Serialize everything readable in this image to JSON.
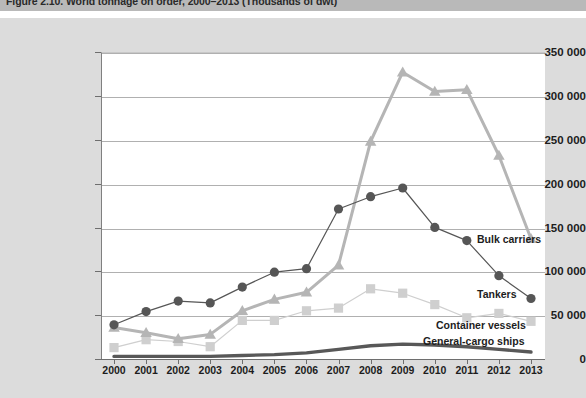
{
  "figure": {
    "caption": "Figure 2.10.  World tonnage on order, 2000–2013 (Thousands of dwt)"
  },
  "colors": {
    "panel_background": "#dcdcdc",
    "plot_background": "#ffffff",
    "caption_bar": "#b9b9b9",
    "gridline": "#b0b0b0",
    "axis": "#6e6e6e",
    "tankers": "#565656",
    "bulk_carriers": "#b5b5b5",
    "container_vessels": "#cfcfcf",
    "general_cargo_ships": "#585858"
  },
  "chart_data": {
    "type": "line",
    "title": "Figure 2.10.  World tonnage on order, 2000–2013 (Thousands of dwt)",
    "xlabel": "",
    "ylabel": "",
    "grid": true,
    "legend_position": "inline-right",
    "ylim": [
      0,
      350000
    ],
    "yticks": [
      0,
      50000,
      100000,
      150000,
      200000,
      250000,
      300000,
      350000
    ],
    "ytick_labels": [
      "0",
      "50 000",
      "100 000",
      "150 000",
      "200 000",
      "250 000",
      "300 000",
      "350 000"
    ],
    "categories": [
      2000,
      2001,
      2002,
      2003,
      2004,
      2005,
      2006,
      2007,
      2008,
      2009,
      2010,
      2011,
      2012,
      2013
    ],
    "xtick_labels": [
      "2000",
      "2001",
      "2002",
      "2003",
      "2004",
      "2005",
      "2006",
      "2007",
      "2008",
      "2009",
      "2010",
      "2011",
      "2012",
      "2013"
    ],
    "series": [
      {
        "name": "Tankers",
        "marker": "circle",
        "color": "#565656",
        "values": [
          39000,
          54000,
          66000,
          64000,
          82000,
          99000,
          103000,
          171000,
          185000,
          195000,
          150000,
          135000,
          95000,
          69000
        ]
      },
      {
        "name": "Bulk carriers",
        "marker": "triangle",
        "color": "#b5b5b5",
        "values": [
          36000,
          30000,
          23000,
          28000,
          55000,
          68000,
          76000,
          107000,
          248000,
          327000,
          305000,
          307000,
          232000,
          137000
        ]
      },
      {
        "name": "Container vessels",
        "marker": "square",
        "color": "#cfcfcf",
        "values": [
          13000,
          22000,
          20000,
          14000,
          44000,
          44000,
          55000,
          58000,
          80000,
          75000,
          62000,
          47000,
          52000,
          43000
        ]
      },
      {
        "name": "General-cargo ships",
        "marker": "none",
        "color": "#585858",
        "values": [
          3000,
          3000,
          3000,
          3000,
          4000,
          5000,
          7000,
          11000,
          15000,
          17000,
          16000,
          14000,
          11000,
          8000
        ]
      }
    ]
  },
  "series_labels": {
    "bulk_carriers": "Bulk carriers",
    "tankers": "Tankers",
    "container_vessels": "Container vessels",
    "general_cargo_ships": "General-cargo ships"
  }
}
